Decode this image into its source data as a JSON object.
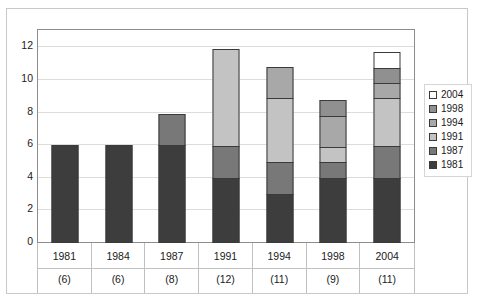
{
  "chart_data": {
    "type": "bar",
    "subtype": "stacked-vertical",
    "title": "",
    "subtitle": "",
    "xlabel": "",
    "ylabel": "",
    "ylim": [
      0,
      13
    ],
    "yticks": [
      0,
      2,
      4,
      6,
      8,
      10,
      12
    ],
    "ytick_labels": [
      "0",
      "2",
      "4",
      "6",
      "8",
      "10",
      "12"
    ],
    "grid": true,
    "grid_axis": "y",
    "legend_position": "right",
    "categories": [
      "1981",
      "1984",
      "1987",
      "1991",
      "1994",
      "1998",
      "2004"
    ],
    "category_sublabels": [
      "(6)",
      "(6)",
      "(8)",
      "(12)",
      "(11)",
      "(9)",
      "(11)"
    ],
    "category_totals": [
      6,
      6,
      8,
      12,
      11,
      9,
      11
    ],
    "series": [
      {
        "name": "1981",
        "color": "#3d3d3d",
        "values": [
          6,
          6,
          6,
          4,
          3,
          4,
          4
        ]
      },
      {
        "name": "1987",
        "color": "#787878",
        "values": [
          0,
          0,
          2,
          2,
          2,
          1,
          2
        ]
      },
      {
        "name": "1991",
        "color": "#c3c3c3",
        "values": [
          0,
          0,
          0,
          6,
          4,
          1,
          3
        ]
      },
      {
        "name": "1994",
        "color": "#a8a8a8",
        "values": [
          0,
          0,
          0,
          0,
          2,
          2,
          1
        ]
      },
      {
        "name": "1998",
        "color": "#909090",
        "values": [
          0,
          0,
          0,
          0,
          0,
          1,
          1
        ]
      },
      {
        "name": "2004",
        "color": "#ffffff",
        "values": [
          0,
          0,
          0,
          0,
          0,
          0,
          1
        ]
      }
    ],
    "legend_entries": [
      {
        "label": "2004",
        "color": "#ffffff"
      },
      {
        "label": "1998",
        "color": "#909090"
      },
      {
        "label": "1994",
        "color": "#a8a8a8"
      },
      {
        "label": "1991",
        "color": "#c3c3c3"
      },
      {
        "label": "1987",
        "color": "#787878"
      },
      {
        "label": "1981",
        "color": "#3d3d3d"
      }
    ],
    "colors": {
      "plot_border": "#8d8d8d",
      "gridline": "#dcdcdc",
      "outer_frame": "#c8c8c8",
      "axis_text": "#1a1a1a",
      "bar_outline": "#3a3a3a"
    }
  }
}
